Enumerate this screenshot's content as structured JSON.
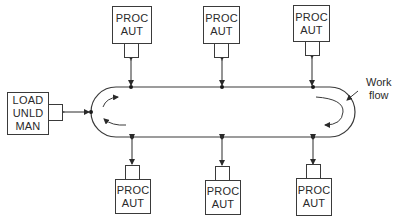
{
  "diagram": {
    "type": "closed-loop work flow layout",
    "line_color": "#3a3a3a",
    "load_station": {
      "lines": [
        "LOAD",
        "UNLD",
        "MAN"
      ]
    },
    "stations_top": [
      {
        "lines": [
          "PROC",
          "AUT"
        ]
      },
      {
        "lines": [
          "PROC",
          "AUT"
        ]
      },
      {
        "lines": [
          "PROC",
          "AUT"
        ]
      }
    ],
    "stations_bottom": [
      {
        "lines": [
          "PROC",
          "AUT"
        ]
      },
      {
        "lines": [
          "PROC",
          "AUT"
        ]
      },
      {
        "lines": [
          "PROC",
          "AUT"
        ]
      }
    ],
    "annotation": {
      "lines": [
        "Work",
        "flow"
      ]
    }
  }
}
